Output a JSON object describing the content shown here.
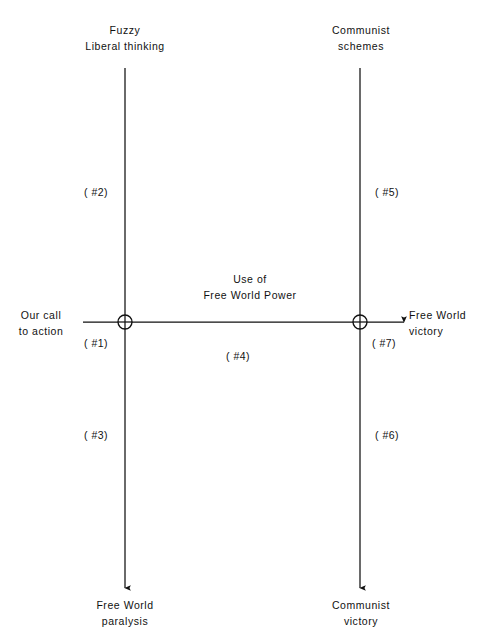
{
  "diagram": {
    "background_color": "#ffffff",
    "line_color": "#111111",
    "text_color": "#111111",
    "nodes": [
      {
        "id": "node-left",
        "label": "",
        "cx": 125,
        "cy": 322,
        "r": 7
      },
      {
        "id": "node-right",
        "label": "",
        "cx": 360,
        "cy": 322,
        "r": 7
      }
    ],
    "labels": {
      "top_left": {
        "line1": "Fuzzy",
        "line2": "Liberal thinking"
      },
      "top_right": {
        "line1": "Communist",
        "line2": "schemes"
      },
      "bottom_left": {
        "line1": "Free World",
        "line2": "paralysis"
      },
      "bottom_right": {
        "line1": "Communist",
        "line2": "victory"
      },
      "left_input": {
        "line1": "Our call",
        "line2": "to action"
      },
      "right_output": {
        "line1": "Free World",
        "line2": "victory"
      },
      "center_axis": {
        "line1": "Use of",
        "line2": "Free World Power"
      }
    },
    "region_tags": {
      "tag1": "( #1)",
      "tag2": "( #2)",
      "tag3": "( #3)",
      "tag4": "( #4)",
      "tag5": "( #5)",
      "tag6": "( #6)",
      "tag7": "( #7)"
    }
  }
}
